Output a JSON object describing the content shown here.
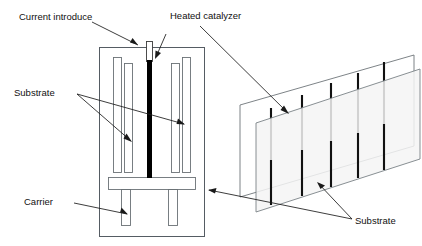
{
  "figure": {
    "background_color": "#ffffff",
    "line_color": "#555c63",
    "filament_color": "#000000",
    "glass_fill_color": "#f4f5f5",
    "text_color": "#111111"
  },
  "labels": {
    "current_introduce": "Current introduce",
    "heated_catalyzer": "Heated catalyzer",
    "substrate_left": "Substrate",
    "carrier": "Carrier",
    "substrate_right": "Substrate"
  },
  "cross_section": {
    "name": "reactor-cross-section",
    "chamber": {
      "x": 99,
      "y": 47,
      "width": 106,
      "height": 190
    },
    "substrate_plates": [
      {
        "id": "substrate-plate-1",
        "x": 113,
        "y": 57,
        "width": 9,
        "height": 116
      },
      {
        "id": "substrate-plate-2",
        "x": 124,
        "y": 63,
        "width": 9,
        "height": 110
      },
      {
        "id": "substrate-plate-3",
        "x": 171,
        "y": 63,
        "width": 9,
        "height": 110
      },
      {
        "id": "substrate-plate-4",
        "x": 182,
        "y": 57,
        "width": 9,
        "height": 116
      }
    ],
    "carrier_bar": {
      "x": 108,
      "y": 177,
      "width": 88,
      "height": 13
    },
    "carrier_legs": [
      {
        "id": "carrier-leg-left",
        "x": 121,
        "y": 190,
        "width": 10,
        "height": 36
      },
      {
        "id": "carrier-leg-right",
        "x": 168,
        "y": 190,
        "width": 10,
        "height": 36
      }
    ],
    "filament": {
      "electrode_top": {
        "x": 146,
        "y": 41,
        "width": 7,
        "height": 20
      },
      "heated_wire": {
        "x": 147,
        "y": 61,
        "width": 5,
        "height": 117
      }
    }
  },
  "perspective_view": {
    "name": "substrate-perspective-view",
    "filament_count": 5,
    "plate_count": 2,
    "back_plate_points": "240,105 240,197 414,146 414,55",
    "front_plate_points": "256,123 256,212 420,159 420,69",
    "filaments": [
      {
        "id": "filament-3d-1",
        "x1": 271,
        "y1": 108,
        "x2": 271,
        "y2": 205
      },
      {
        "id": "filament-3d-2",
        "x1": 302,
        "y1": 95,
        "x2": 302,
        "y2": 196
      },
      {
        "id": "filament-3d-3",
        "x1": 331,
        "y1": 83,
        "x2": 331,
        "y2": 187
      },
      {
        "id": "filament-3d-4",
        "x1": 358,
        "y1": 73,
        "x2": 358,
        "y2": 178
      },
      {
        "id": "filament-3d-5",
        "x1": 384,
        "y1": 62,
        "x2": 384,
        "y2": 170
      }
    ]
  },
  "leaders": {
    "current_introduce": "92,22 138,45",
    "heated_catalyzer_to_filament": "166,34 155,58",
    "heated_catalyzer_to_3d": "200,26 288,113",
    "substrate_left_a": "77,94 131,141",
    "substrate_left_b": "77,94 184,124",
    "carrier": "74,203 127,214",
    "substrate_right_a": "352,219 209,190",
    "substrate_right_b": "352,219 318,183"
  }
}
